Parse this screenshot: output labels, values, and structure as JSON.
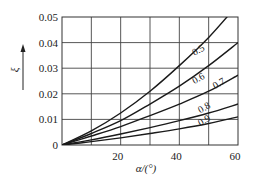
{
  "chart_data": {
    "type": "line",
    "title": "",
    "xlabel": "α/(°)",
    "ylabel": "ξ",
    "xlim": [
      0,
      60
    ],
    "ylim": [
      0,
      0.05
    ],
    "grid": true,
    "x_gridlines": [
      10,
      20,
      30,
      40,
      50
    ],
    "y_gridlines": [
      0.01,
      0.02,
      0.03,
      0.04
    ],
    "x_tick_labels": [
      "20",
      "40",
      "60"
    ],
    "x_ticks": [
      20,
      40,
      60
    ],
    "y_tick_labels": [
      "0",
      "0.01",
      "0.02",
      "0.03",
      "0.04",
      "0.05"
    ],
    "y_ticks": [
      0,
      0.01,
      0.02,
      0.03,
      0.04,
      0.05
    ],
    "legend": null,
    "x": [
      0,
      10,
      20,
      30,
      40,
      50,
      60
    ],
    "series": [
      {
        "name": "0.5",
        "label_pos": [
          47,
          0.036
        ],
        "values": [
          0,
          0.0055,
          0.0125,
          0.021,
          0.031,
          0.042,
          0.055
        ]
      },
      {
        "name": "0.6",
        "label_pos": [
          47,
          0.025
        ],
        "values": [
          0,
          0.0045,
          0.0095,
          0.016,
          0.023,
          0.031,
          0.04
        ]
      },
      {
        "name": "0.7",
        "label_pos": [
          54,
          0.023
        ],
        "values": [
          0,
          0.0035,
          0.0072,
          0.0115,
          0.016,
          0.021,
          0.0273
        ]
      },
      {
        "name": "0.8",
        "label_pos": [
          49,
          0.0135
        ],
        "values": [
          0,
          0.002,
          0.0043,
          0.0068,
          0.0095,
          0.0125,
          0.016
        ]
      },
      {
        "name": "0.9",
        "label_pos": [
          49,
          0.0085
        ],
        "values": [
          0,
          0.0013,
          0.0028,
          0.0045,
          0.0063,
          0.0084,
          0.011
        ]
      }
    ]
  }
}
